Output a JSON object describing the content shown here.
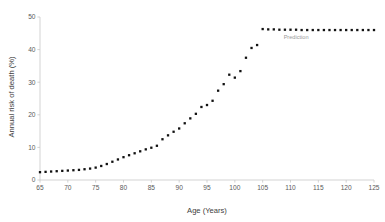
{
  "chart_data": {
    "type": "scatter",
    "title": "",
    "xlabel": "Age (Years)",
    "ylabel": "Annual risk of death (%)",
    "xlim": [
      65,
      125
    ],
    "ylim": [
      0,
      50
    ],
    "xticks": [
      65,
      70,
      75,
      80,
      85,
      90,
      95,
      100,
      105,
      110,
      115,
      120,
      125
    ],
    "ytick_labels": [
      "0",
      "10",
      "20",
      "30",
      "40",
      "50"
    ],
    "xtick_labels": [
      "65",
      "70",
      "75",
      "80",
      "85",
      "90",
      "95",
      "100",
      "105",
      "110",
      "115",
      "120",
      "125"
    ],
    "yticks": [
      0,
      10,
      20,
      30,
      40,
      50
    ],
    "grid": false,
    "legend": false,
    "marker_color": "#111111",
    "axis_color": "#c8c8c8",
    "background": "#ffffff",
    "series": [
      {
        "name": "Annual risk of death",
        "x": [
          65,
          66,
          67,
          68,
          69,
          70,
          71,
          72,
          73,
          74,
          75,
          76,
          77,
          78,
          79,
          80,
          81,
          82,
          83,
          84,
          85,
          86,
          87,
          88,
          89,
          90,
          91,
          92,
          93,
          94,
          95,
          96,
          97,
          98,
          99,
          100,
          101,
          102,
          103,
          104,
          105,
          106,
          107,
          108,
          109,
          110,
          111,
          112,
          113,
          114,
          115,
          116,
          117,
          118,
          119,
          120,
          121,
          122,
          123,
          124,
          125
        ],
        "values": [
          2.4,
          2.5,
          2.6,
          2.7,
          2.8,
          2.9,
          3.0,
          3.1,
          3.3,
          3.5,
          3.8,
          4.3,
          4.9,
          5.6,
          6.3,
          7.0,
          7.6,
          8.2,
          8.8,
          9.4,
          9.9,
          10.5,
          12.5,
          13.7,
          14.8,
          15.8,
          17.4,
          18.9,
          20.3,
          22.4,
          23.0,
          24.3,
          27.4,
          29.4,
          32.3,
          31.4,
          33.4,
          37.5,
          40.5,
          41.4,
          46.3,
          46.2,
          46.2,
          46.1,
          46.1,
          46.1,
          46.1,
          46.0,
          46.0,
          46.0,
          46.0,
          46.0,
          46.0,
          46.0,
          46.0,
          46.0,
          46.0,
          46.0,
          46.0,
          46.0,
          46.0
        ]
      }
    ],
    "annotations": [
      {
        "text": "Prediction",
        "x": 111,
        "y": 43.2,
        "color": "#9a9a9a"
      }
    ]
  }
}
